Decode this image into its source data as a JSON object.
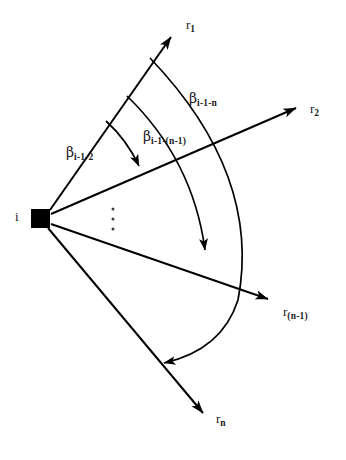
{
  "figure": {
    "type": "geometric-diagram",
    "background_color": "#ffffff",
    "stroke_color": "#000000",
    "top_clipped_header": "",
    "vertex": {
      "label": "i",
      "marker": "filled-square",
      "x": 40,
      "y": 218,
      "size": 19
    },
    "rays": [
      {
        "id": "r1",
        "base": "r",
        "subscript": "1",
        "label": "r₁",
        "angle_deg": -55,
        "tip_x": 175,
        "tip_y": 32
      },
      {
        "id": "r2",
        "base": "r",
        "subscript": "2",
        "label": "r₂",
        "angle_deg": -22,
        "tip_x": 300,
        "tip_y": 105
      },
      {
        "id": "r_n_minus_1",
        "base": "r",
        "subscript": "(n-1)",
        "label": "r₍ₙ₋₁₎",
        "angle_deg": 18,
        "tip_x": 272,
        "tip_y": 302
      },
      {
        "id": "rn",
        "base": "r",
        "subscript": "n",
        "label": "rₙ",
        "angle_deg": 55,
        "tip_x": 206,
        "tip_y": 418
      }
    ],
    "ellipsis": {
      "glyph": "⋮",
      "dots": 3,
      "x": 113,
      "y_start": 208,
      "y_end": 230
    },
    "angle_arcs": [
      {
        "id": "beta-i-1-2",
        "base": "β",
        "subscript": "i-1-2",
        "label": "β i-1-2",
        "from_ray": "r1",
        "to_ray": "r2",
        "arrow_end": "to_ray",
        "radius": 78
      },
      {
        "id": "beta-i-1-(n-1)",
        "base": "β",
        "subscript": "i-1-(n-1)",
        "label": "β i-1-(n-1)",
        "from_ray": "r1",
        "to_ray": "r_n_minus_1",
        "arrow_end": "to_ray",
        "radius": 140
      },
      {
        "id": "beta-i-1-n",
        "base": "β",
        "subscript": "i-1-n",
        "label": "β i-1-n",
        "from_ray": "r1",
        "to_ray": "rn",
        "arrow_end": "to_ray",
        "radius": 182
      }
    ]
  }
}
